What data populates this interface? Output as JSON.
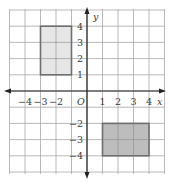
{
  "diagram": {
    "type": "coordinate-plane",
    "x_range": [
      -5,
      5
    ],
    "y_range": [
      -5,
      5
    ],
    "axis_labels": {
      "x": "x",
      "y": "y",
      "origin": "O"
    },
    "x_tick_labels": [
      "−4",
      "−3",
      "−2",
      "1",
      "2",
      "3",
      "4"
    ],
    "y_tick_labels": [
      "4",
      "3",
      "2",
      "1",
      "−2",
      "−3",
      "−4"
    ],
    "shapes": [
      {
        "name": "rectangle-upper-left",
        "corners": [
          [
            -3,
            4
          ],
          [
            -1,
            4
          ],
          [
            -1,
            1
          ],
          [
            -3,
            1
          ]
        ],
        "fill": "#e6e6e6",
        "stroke": "#6e6e6e"
      },
      {
        "name": "rectangle-lower-right",
        "corners": [
          [
            1,
            -2
          ],
          [
            4,
            -2
          ],
          [
            4,
            -4
          ],
          [
            1,
            -4
          ]
        ],
        "fill": "#bdbdbd",
        "stroke": "#6e6e6e"
      }
    ],
    "colors": {
      "grid": "#9a9a9a",
      "axis": "#222222"
    }
  }
}
